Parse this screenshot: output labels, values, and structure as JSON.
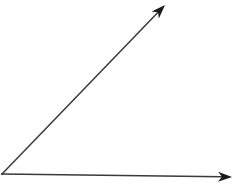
{
  "diagram": {
    "type": "angle",
    "background": "#ffffff",
    "stroke_color": "#3a3a3a",
    "stroke_width": 1.5,
    "vertex": {
      "x": 2,
      "y": 174
    },
    "rays": [
      {
        "name": "upper-ray",
        "end": {
          "x": 165,
          "y": 5
        },
        "arrowhead": true
      },
      {
        "name": "horizontal-ray",
        "end": {
          "x": 232,
          "y": 177
        },
        "arrowhead": true
      }
    ]
  }
}
